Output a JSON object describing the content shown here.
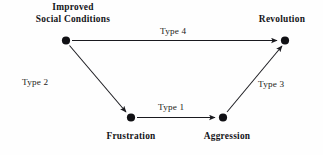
{
  "diagram": {
    "background_color": "#fefefe",
    "stroke_color": "#1a1a1f",
    "node_color": "#101014",
    "nodes": [
      {
        "id": "improved-social-conditions",
        "label_line_1": "Improved",
        "label_line_2": "Social Conditions",
        "x": 66,
        "y": 40
      },
      {
        "id": "revolution",
        "label": "Revolution",
        "x": 285,
        "y": 40
      },
      {
        "id": "frustration",
        "label": "Frustration",
        "x": 131,
        "y": 117
      },
      {
        "id": "aggression",
        "label": "Aggression",
        "x": 223,
        "y": 117
      }
    ],
    "edges": [
      {
        "id": "type-4",
        "label": "Type 4",
        "from": "improved-social-conditions",
        "to": "revolution"
      },
      {
        "id": "type-2",
        "label": "Type 2",
        "from": "improved-social-conditions",
        "to": "frustration"
      },
      {
        "id": "type-1",
        "label": "Type 1",
        "from": "frustration",
        "to": "aggression"
      },
      {
        "id": "type-3",
        "label": "Type 3",
        "from": "aggression",
        "to": "revolution"
      }
    ]
  }
}
